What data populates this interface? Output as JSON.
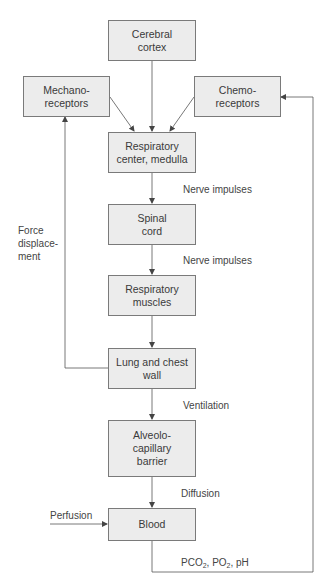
{
  "diagram": {
    "type": "flowchart",
    "nodes": [
      {
        "id": "cortex",
        "label": "Cerebral\ncortex"
      },
      {
        "id": "mechano",
        "label": "Mechano-\nreceptors"
      },
      {
        "id": "chemo",
        "label": "Chemo-\nreceptors"
      },
      {
        "id": "center",
        "label": "Respiratory\ncenter, medulla"
      },
      {
        "id": "spinal",
        "label": "Spinal\ncord"
      },
      {
        "id": "muscles",
        "label": "Respiratory\nmuscles"
      },
      {
        "id": "lung",
        "label": "Lung and chest\nwall"
      },
      {
        "id": "alveolo",
        "label": "Alveolo-\ncapillary\nbarrier"
      },
      {
        "id": "blood",
        "label": "Blood"
      }
    ],
    "edges": [
      {
        "from": "cortex",
        "to": "center",
        "label": ""
      },
      {
        "from": "mechano",
        "to": "center",
        "label": ""
      },
      {
        "from": "chemo",
        "to": "center",
        "label": ""
      },
      {
        "from": "center",
        "to": "spinal",
        "label": "Nerve impulses"
      },
      {
        "from": "spinal",
        "to": "muscles",
        "label": "Nerve impulses"
      },
      {
        "from": "muscles",
        "to": "lung",
        "label": ""
      },
      {
        "from": "lung",
        "to": "mechano",
        "label": "Force\ndisplace-\nment"
      },
      {
        "from": "lung",
        "to": "alveolo",
        "label": "Ventilation"
      },
      {
        "from": "alveolo",
        "to": "blood",
        "label": "Diffusion"
      },
      {
        "from": "perfusion",
        "to": "blood",
        "label": "Perfusion"
      },
      {
        "from": "blood",
        "to": "chemo",
        "label": "PCO2, PO2, pH"
      }
    ],
    "labels": {
      "nerve1": "Nerve impulses",
      "nerve2": "Nerve impulses",
      "force": "Force\ndisplace-\nment",
      "ventilation": "Ventilation",
      "diffusion": "Diffusion",
      "perfusion": "Perfusion",
      "gas_pco": "PCO",
      "gas_sub1": "2",
      "gas_po": ", PO",
      "gas_sub2": "2",
      "gas_ph": ", pH"
    }
  },
  "colors": {
    "box_fill": "#ececec",
    "box_border": "#7a7a7a",
    "line": "#555555"
  }
}
